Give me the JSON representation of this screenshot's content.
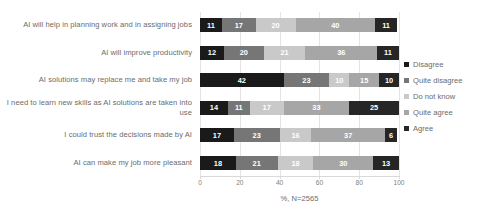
{
  "chart_data": {
    "type": "bar",
    "orientation": "horizontal",
    "stacked": true,
    "stack_mode": "percent",
    "title": "",
    "subtitle": "",
    "xlabel": "%, N=2565",
    "ylabel": "",
    "xlim": [
      0,
      100
    ],
    "xticks": [
      0,
      20,
      40,
      60,
      80,
      100
    ],
    "xtick_labels": [
      "0",
      "20",
      "40",
      "60",
      "80",
      "100"
    ],
    "grid": true,
    "grid_axis": "x",
    "legend_position": "right",
    "categories": [
      "AI will help in planning work and in assigning jobs",
      "AI will improve productivity",
      "AI solutions may replace me and take my job",
      "I need to learn new skills as AI solutions are taken into use",
      "I could trust the decisions made by AI",
      "AI can make my job more pleasant"
    ],
    "series": [
      {
        "name": "Disagree",
        "color": "#1a1a1a",
        "values": [
          11,
          12,
          42,
          14,
          17,
          18
        ]
      },
      {
        "name": "Quite disagree",
        "color": "#767676",
        "values": [
          17,
          20,
          23,
          11,
          23,
          21
        ]
      },
      {
        "name": "Do not know",
        "color": "#c9c9c9",
        "values": [
          20,
          21,
          10,
          17,
          16,
          18
        ]
      },
      {
        "name": "Quite agree",
        "color": "#a6a6a6",
        "values": [
          40,
          36,
          15,
          33,
          37,
          30
        ]
      },
      {
        "name": "Agree",
        "color": "#262626",
        "values": [
          11,
          11,
          10,
          25,
          6,
          13
        ]
      }
    ]
  },
  "legend": {
    "items": [
      {
        "label": "Disagree",
        "color": "#1a1a1a"
      },
      {
        "label": "Quite disagree",
        "color": "#767676"
      },
      {
        "label": "Do not know",
        "color": "#c9c9c9"
      },
      {
        "label": "Quite agree",
        "color": "#a6a6a6"
      },
      {
        "label": "Agree",
        "color": "#262626"
      }
    ]
  },
  "axis": {
    "caption": "%, N=2565"
  }
}
